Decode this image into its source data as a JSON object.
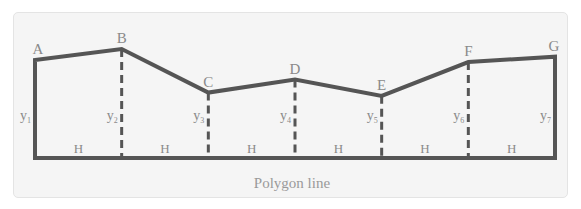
{
  "diagram": {
    "caption": "Polygon line",
    "line_color": "#555555",
    "label_color": "#8a8a8a",
    "points": [
      {
        "name": "A",
        "rel_height": 0.9
      },
      {
        "name": "B",
        "rel_height": 1.0
      },
      {
        "name": "C",
        "rel_height": 0.6
      },
      {
        "name": "D",
        "rel_height": 0.72
      },
      {
        "name": "E",
        "rel_height": 0.57
      },
      {
        "name": "F",
        "rel_height": 0.88
      },
      {
        "name": "G",
        "rel_height": 0.93
      }
    ],
    "ordinates": [
      {
        "base": "y",
        "sub": "1"
      },
      {
        "base": "y",
        "sub": "2"
      },
      {
        "base": "y",
        "sub": "3"
      },
      {
        "base": "y",
        "sub": "4"
      },
      {
        "base": "y",
        "sub": "5"
      },
      {
        "base": "y",
        "sub": "6"
      },
      {
        "base": "y",
        "sub": "7"
      }
    ],
    "interval_label": "H",
    "interval_count": 6
  }
}
